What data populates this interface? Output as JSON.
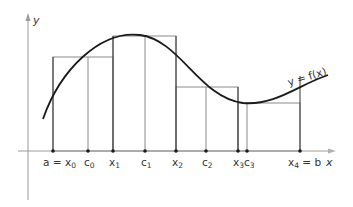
{
  "diagram": {
    "axes": {
      "x_label": "x",
      "y_label": "y"
    },
    "curve_label": "y = f(x)",
    "colors": {
      "curve": "#1a1a1a",
      "rect": "#8a8a8a",
      "axis": "#9a9a9a",
      "text": "#333333"
    },
    "partition_points": [
      {
        "id": "x0",
        "label": "a = x",
        "sub": "0",
        "px": 53
      },
      {
        "id": "c0",
        "label": "c",
        "sub": "0",
        "px": 88
      },
      {
        "id": "x1",
        "label": "x",
        "sub": "1",
        "px": 113
      },
      {
        "id": "c1",
        "label": "c",
        "sub": "1",
        "px": 145
      },
      {
        "id": "x2",
        "label": "x",
        "sub": "2",
        "px": 176
      },
      {
        "id": "c2",
        "label": "c",
        "sub": "2",
        "px": 206
      },
      {
        "id": "x3",
        "label": "x",
        "sub": "3",
        "px": 238
      },
      {
        "id": "c3",
        "label": "c",
        "sub": "3",
        "px": 247
      },
      {
        "id": "x4",
        "label": "x",
        "sub": "4",
        "suffix": " = b",
        "px": 300
      }
    ],
    "rectangles": [
      {
        "from": "x0",
        "to": "x1",
        "sample": "c0",
        "top_px": 57
      },
      {
        "from": "x1",
        "to": "x2",
        "sample": "c1",
        "top_px": 36
      },
      {
        "from": "x2",
        "to": "x3",
        "sample": "c2",
        "top_px": 87
      },
      {
        "from": "x3",
        "to": "x4",
        "sample": "c3",
        "top_px": 103
      }
    ],
    "labels": {
      "x0_main": "a = x",
      "x0_sub": "0",
      "c0_main": "c",
      "c0_sub": "0",
      "x1_main": "x",
      "x1_sub": "1",
      "c1_main": "c",
      "c1_sub": "1",
      "x2_main": "x",
      "x2_sub": "2",
      "c2_main": "c",
      "c2_sub": "2",
      "x3_main": "x",
      "x3_sub": "3",
      "c3_main": "c",
      "c3_sub": "3",
      "x4_main": "x",
      "x4_sub": "4",
      "x4_suffix": " = b"
    }
  }
}
